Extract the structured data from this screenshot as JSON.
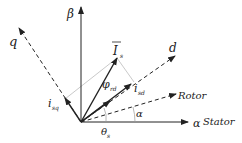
{
  "diagram": {
    "colors": {
      "line": "#222222",
      "guide": "#bbbbbb",
      "background": "#ffffff"
    },
    "labels": {
      "beta": "β",
      "q": "q",
      "d": "d",
      "is_main": "I",
      "is_sub": "s",
      "phi_main": "φ",
      "phi_sub": "rd",
      "isd_main": "i",
      "isd_sub": "sd",
      "isq_main": "i",
      "isq_sub": "sq",
      "rotor": "Rotor",
      "alpha_axis": "α",
      "stator": "Stator",
      "alpha_angle": "α",
      "theta_main": "θ",
      "theta_sub": "s"
    }
  }
}
